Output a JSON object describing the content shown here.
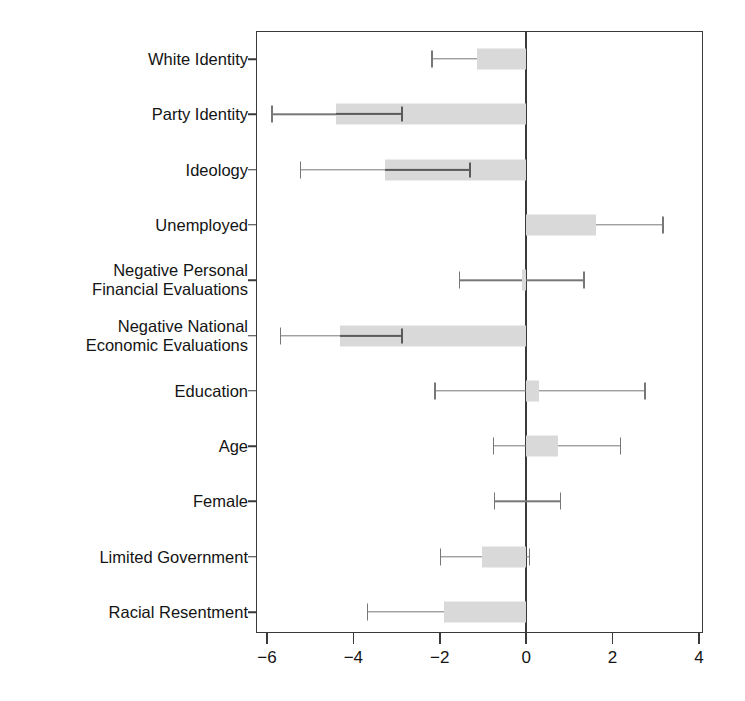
{
  "chart_data": {
    "type": "bar",
    "orientation": "horizontal",
    "title": "",
    "subtitle": "",
    "xlabel": "",
    "ylabel": "",
    "xlim": [
      -7,
      4.1
    ],
    "xticks": [
      -6,
      -4,
      -2,
      0,
      2,
      4
    ],
    "xtick_labels": [
      "−6",
      "−4",
      "−2",
      "0",
      "2",
      "4"
    ],
    "grid": false,
    "legend": null,
    "zero_reference_line": 0,
    "categories": [
      "White Identity",
      "Party Identity",
      "Ideology",
      "Unemployed",
      "Negative Personal\nFinancial Evaluations",
      "Negative National\nEconomic Evaluations",
      "Education",
      "Age",
      "Female",
      "Limited Government",
      "Racial Resentment"
    ],
    "series": [
      {
        "name": "Coefficient estimate",
        "values": [
          -1.13,
          -4.4,
          -3.26,
          1.62,
          -0.1,
          -4.31,
          0.3,
          0.74,
          0.0,
          -1.02,
          -1.9
        ]
      },
      {
        "name": "Outer confidence interval lower",
        "values": [
          -2.18,
          -5.88,
          -5.23,
          0.0,
          -1.55,
          -5.69,
          -2.11,
          -0.76,
          -0.74,
          -1.99,
          -3.68
        ]
      },
      {
        "name": "Outer confidence interval upper",
        "values": [
          -0.1,
          0.0,
          0.0,
          3.17,
          1.34,
          0.0,
          2.75,
          2.18,
          0.79,
          0.07,
          0.0
        ]
      },
      {
        "name": "Inner interval bound",
        "values": [
          -2.18,
          -2.87,
          -1.3,
          0.0,
          -1.55,
          -2.87,
          -2.11,
          -0.76,
          -0.74,
          -1.99,
          -3.68
        ]
      }
    ],
    "rows": [
      {
        "label": "White Identity",
        "estimate": -1.13,
        "ci_low": -2.18,
        "ci_high": -0.1,
        "inner_bound": -2.18,
        "inner_cap": false
      },
      {
        "label": "Party Identity",
        "estimate": -4.4,
        "ci_low": -5.88,
        "ci_high": 0.0,
        "inner_bound": -2.87,
        "inner_cap": true
      },
      {
        "label": "Ideology",
        "estimate": -3.26,
        "ci_low": -5.23,
        "ci_high": 0.0,
        "inner_bound": -1.3,
        "inner_cap": true
      },
      {
        "label": "Unemployed",
        "estimate": 1.62,
        "ci_low": 0.0,
        "ci_high": 3.17,
        "inner_bound": 0.0,
        "inner_cap": false
      },
      {
        "label": "Negative Personal\nFinancial Evaluations",
        "estimate": -0.1,
        "ci_low": -1.55,
        "ci_high": 1.34,
        "inner_bound": -1.55,
        "inner_cap": false
      },
      {
        "label": "Negative National\nEconomic Evaluations",
        "estimate": -4.31,
        "ci_low": -5.69,
        "ci_high": 0.0,
        "inner_bound": -2.87,
        "inner_cap": true
      },
      {
        "label": "Education",
        "estimate": 0.3,
        "ci_low": -2.11,
        "ci_high": 2.75,
        "inner_bound": -2.11,
        "inner_cap": false
      },
      {
        "label": "Age",
        "estimate": 0.74,
        "ci_low": -0.76,
        "ci_high": 2.18,
        "inner_bound": -0.76,
        "inner_cap": false
      },
      {
        "label": "Female",
        "estimate": 0.0,
        "ci_low": -0.74,
        "ci_high": 0.79,
        "inner_bound": -0.74,
        "inner_cap": false
      },
      {
        "label": "Limited Government",
        "estimate": -1.02,
        "ci_low": -1.99,
        "ci_high": 0.07,
        "inner_bound": -1.99,
        "inner_cap": false
      },
      {
        "label": "Racial Resentment",
        "estimate": -1.9,
        "ci_low": -3.68,
        "ci_high": 0.0,
        "inner_bound": -3.68,
        "inner_cap": false
      }
    ]
  },
  "colors": {
    "box_fill": "#d9d9d9",
    "whisker": "#777777",
    "inner_line": "#5a5a5a",
    "axis": "#3a3a3a",
    "text": "#141414",
    "background": "#ffffff"
  }
}
